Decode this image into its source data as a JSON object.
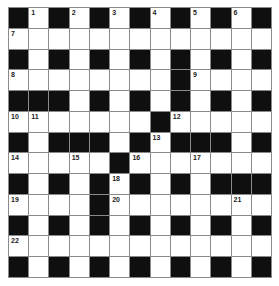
{
  "puzzle": {
    "type": "crossword",
    "size": {
      "rows": 13,
      "cols": 13
    },
    "colors": {
      "block": "#0f0f0f",
      "cell": "#ffffff",
      "gridline": "#8a8a8a"
    },
    "layout": [
      "#.#.#.#.#.#.#",
      ".............",
      "#.#.#.#.#.#.#",
      "........#....",
      "###.#.#.#.#.#",
      ".......#.....",
      "#.###.#.###.#",
      ".....#.......",
      "#.#.#.#.#.###",
      "....#........",
      "#.#.#.#.#.#.#",
      ".............",
      "#.#.#.#.#.#.#"
    ],
    "numbers": [
      {
        "row": 0,
        "col": 1,
        "n": "1"
      },
      {
        "row": 0,
        "col": 3,
        "n": "2"
      },
      {
        "row": 0,
        "col": 5,
        "n": "3"
      },
      {
        "row": 0,
        "col": 7,
        "n": "4"
      },
      {
        "row": 0,
        "col": 9,
        "n": "5"
      },
      {
        "row": 0,
        "col": 11,
        "n": "6"
      },
      {
        "row": 1,
        "col": 0,
        "n": "7"
      },
      {
        "row": 3,
        "col": 0,
        "n": "8"
      },
      {
        "row": 3,
        "col": 9,
        "n": "9"
      },
      {
        "row": 5,
        "col": 0,
        "n": "10"
      },
      {
        "row": 5,
        "col": 1,
        "n": "11"
      },
      {
        "row": 5,
        "col": 8,
        "n": "12"
      },
      {
        "row": 6,
        "col": 7,
        "n": "13"
      },
      {
        "row": 7,
        "col": 0,
        "n": "14"
      },
      {
        "row": 7,
        "col": 3,
        "n": "15"
      },
      {
        "row": 7,
        "col": 6,
        "n": "16"
      },
      {
        "row": 7,
        "col": 9,
        "n": "17"
      },
      {
        "row": 8,
        "col": 5,
        "n": "18"
      },
      {
        "row": 9,
        "col": 0,
        "n": "19"
      },
      {
        "row": 9,
        "col": 5,
        "n": "20"
      },
      {
        "row": 9,
        "col": 11,
        "n": "21"
      },
      {
        "row": 11,
        "col": 0,
        "n": "22"
      }
    ]
  }
}
